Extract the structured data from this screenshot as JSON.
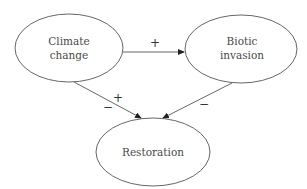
{
  "diagram": {
    "type": "causal-loop",
    "colors": {
      "stroke": "#555555",
      "text": "#4a4a4a",
      "background": "#ffffff"
    },
    "nodes": [
      {
        "id": "climate",
        "lines": [
          "Climate",
          "change"
        ]
      },
      {
        "id": "biotic",
        "lines": [
          "Biotic",
          "invasion"
        ]
      },
      {
        "id": "restoration",
        "lines": [
          "Restoration"
        ]
      }
    ],
    "edges": [
      {
        "from": "climate",
        "to": "biotic",
        "signs": [
          "+"
        ]
      },
      {
        "from": "climate",
        "to": "restoration",
        "signs": [
          "+",
          "−"
        ]
      },
      {
        "from": "biotic",
        "to": "restoration",
        "signs": [
          "−"
        ]
      }
    ]
  }
}
